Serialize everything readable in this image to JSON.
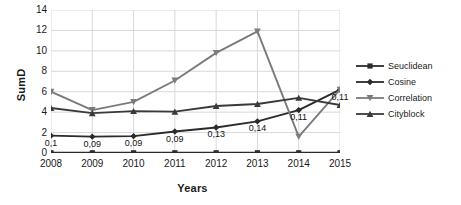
{
  "chart_data": {
    "type": "line",
    "title": "",
    "xlabel": "Years",
    "ylabel": "SumD",
    "categories": [
      "2008",
      "2009",
      "2010",
      "2011",
      "2012",
      "2013",
      "2014",
      "2015"
    ],
    "ylim": [
      0,
      14
    ],
    "yticks": [
      "0",
      "2",
      "4",
      "6",
      "8",
      "10",
      "12",
      "14"
    ],
    "grid": true,
    "legend_position": "right",
    "series": [
      {
        "name": "Seuclidean",
        "color": "#2b2b2b",
        "marker": "square",
        "values": [
          0.02,
          0.02,
          0.02,
          0.02,
          0.02,
          0.02,
          0.02,
          0.02
        ]
      },
      {
        "name": "Cosine",
        "color": "#2b2b2b",
        "marker": "diamond",
        "values": [
          1.7,
          1.6,
          1.65,
          2.1,
          2.5,
          3.1,
          4.2,
          6.2
        ],
        "point_labels": [
          "0,1",
          "0,09",
          "0,09",
          "0,09",
          "0,13",
          "0,14",
          "0,11",
          "0,11"
        ]
      },
      {
        "name": "Correlation",
        "color": "#7b7b7b",
        "marker": "triangle-down",
        "values": [
          6.0,
          4.2,
          5.0,
          7.1,
          9.8,
          11.9,
          1.6,
          6.2
        ]
      },
      {
        "name": "Cityblock",
        "color": "#3a3a3a",
        "marker": "triangle-up",
        "values": [
          4.4,
          3.9,
          4.1,
          4.05,
          4.6,
          4.8,
          5.4,
          4.7
        ]
      }
    ]
  },
  "axes": {
    "y_title": "SumD",
    "x_title": "Years"
  },
  "legend": {
    "items": [
      {
        "label": "Seuclidean"
      },
      {
        "label": "Cosine"
      },
      {
        "label": "Correlation"
      },
      {
        "label": "Cityblock"
      }
    ]
  }
}
